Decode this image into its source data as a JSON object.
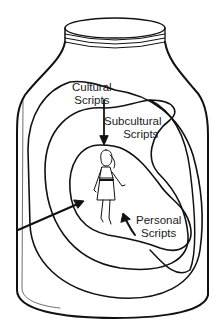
{
  "diagram": {
    "type": "nested-regions-in-jar",
    "labels": {
      "cultural": [
        "Cultural",
        "Scripts"
      ],
      "subcultural": [
        "Subcultural",
        "Scripts"
      ],
      "personal": [
        "Personal",
        "Scripts"
      ]
    },
    "figure": "woman-figure",
    "colors": {
      "ink": "#111111",
      "background": "#ffffff"
    }
  }
}
